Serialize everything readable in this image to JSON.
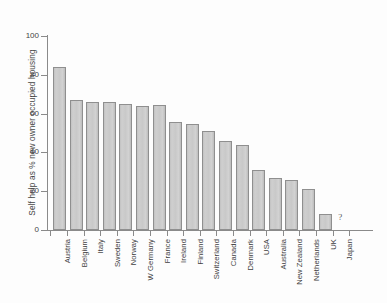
{
  "chart_data": {
    "type": "bar",
    "title": "",
    "subtitle": "",
    "xlabel": "",
    "ylabel": "Self help as % new owner occupied housing",
    "ylim": [
      0,
      100
    ],
    "ytick_values": [
      0,
      20,
      40,
      60,
      80,
      100
    ],
    "ytick_labels": [
      "0",
      "20",
      "40",
      "60",
      "80",
      "100"
    ],
    "grid": false,
    "legend": null,
    "orientation": "vertical",
    "bar_color": "#c9c9c9",
    "bar_edge_color": "#8f8f8f",
    "axis_color": "#8a8a8a",
    "categories": [
      "Austria",
      "Belgium",
      "Italy",
      "Sweden",
      "Norway",
      "W Germany",
      "France",
      "Ireland",
      "Finland",
      "Switzerland",
      "Canada",
      "Denmark",
      "USA",
      "Australia",
      "New Zealand",
      "Netherlands",
      "UK",
      "Japan"
    ],
    "values": [
      84,
      67,
      66,
      66,
      65,
      64,
      64.5,
      55.5,
      54.5,
      51,
      46,
      44,
      31,
      27,
      26,
      21,
      8,
      null
    ],
    "annotations": [
      {
        "category": "Japan",
        "text": "?",
        "meaning": "no-data"
      }
    ]
  }
}
